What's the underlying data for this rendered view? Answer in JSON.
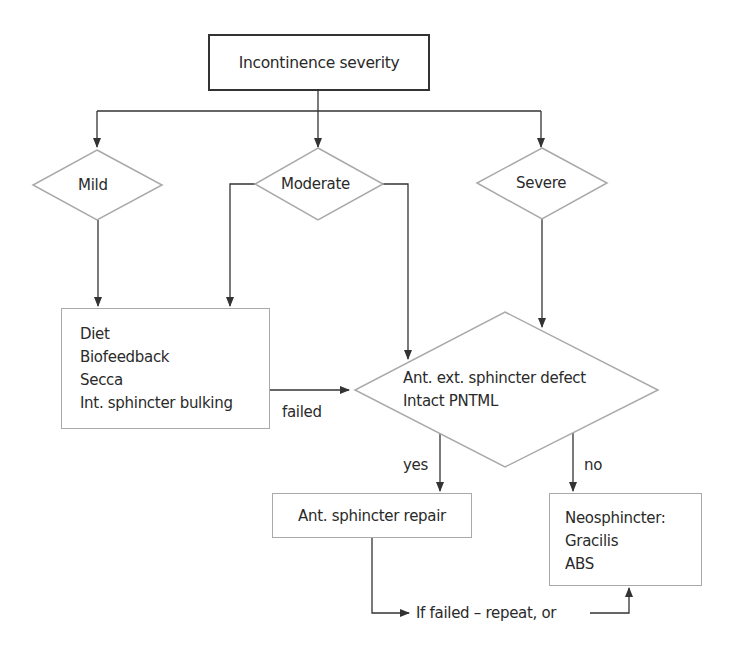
{
  "diagram": {
    "root": {
      "label": "Incontinence severity"
    },
    "severity_levels": [
      {
        "label": "Mild"
      },
      {
        "label": "Moderate"
      },
      {
        "label": "Severe"
      }
    ],
    "conservative_treatment": {
      "items": [
        "Diet",
        "Biofeedback",
        "Secca",
        "Int. sphincter bulking"
      ]
    },
    "decision": {
      "lines": [
        "Ant. ext. sphincter defect",
        "Intact PNTML"
      ]
    },
    "edge_labels": {
      "failed": "failed",
      "yes": "yes",
      "no": "no",
      "if_failed": "If failed – repeat, or"
    },
    "repair": {
      "label": "Ant. sphincter repair"
    },
    "neosphincter": {
      "lines": [
        "Neosphincter:",
        "Gracilis",
        "ABS"
      ]
    },
    "colors": {
      "arrow": "#333333",
      "shape_border_light": "#a9a9a9",
      "shape_border_dark": "#333333",
      "text": "#2a2a2a"
    }
  }
}
